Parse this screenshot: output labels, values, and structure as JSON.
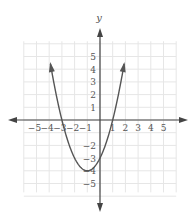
{
  "chart_data": {
    "type": "line",
    "title": "",
    "xlabel": "",
    "ylabel": "y",
    "function": "y = x^2 + 2x - 3",
    "vertex": [
      -1,
      -4
    ],
    "x_intercepts": [
      -3,
      1
    ],
    "y_intercept": -3,
    "x_ticks": [
      "-5",
      "-4",
      "-3",
      "-2",
      "-1",
      "1",
      "2",
      "3",
      "4",
      "5"
    ],
    "y_ticks": [
      "5",
      "4",
      "3",
      "2",
      "1",
      "-2",
      "-3",
      "-4",
      "-5"
    ],
    "xlim": [
      -6,
      6
    ],
    "ylim": [
      -6,
      6
    ],
    "grid": true,
    "legend": null,
    "series": [
      {
        "name": "parabola",
        "x": [
          -3.9,
          -3.5,
          -3,
          -2.5,
          -2,
          -1.5,
          -1,
          -0.5,
          0,
          0.5,
          1,
          1.5,
          1.9
        ],
        "y": [
          4.41,
          2.25,
          0,
          -1.75,
          -3,
          -3.75,
          -4,
          -3.75,
          -3,
          -1.75,
          0,
          2.25,
          4.41
        ]
      }
    ]
  },
  "axis": {
    "y_label": "y"
  },
  "colors": {
    "curve": "#555555",
    "axis": "#444444",
    "grid": "#e6e6e6",
    "label": "#555555"
  }
}
